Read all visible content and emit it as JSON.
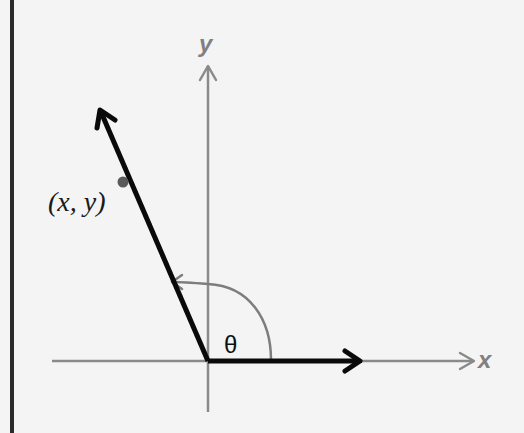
{
  "diagram": {
    "labels": {
      "x_axis": "x",
      "y_axis": "y",
      "point": "(x, y)",
      "angle": "θ"
    },
    "colors": {
      "background": "#f4f4f4",
      "axis": "#8a8a8a",
      "vector": "#0a0a0a",
      "arc": "#7d7d7d",
      "point": "#5a5a5a",
      "border": "#2a2a2a"
    },
    "elements": [
      {
        "type": "axis",
        "name": "x-axis",
        "direction": "horizontal"
      },
      {
        "type": "axis",
        "name": "y-axis",
        "direction": "vertical"
      },
      {
        "type": "vector",
        "name": "reference-vector",
        "direction": "along positive x-axis"
      },
      {
        "type": "vector",
        "name": "rotated-vector",
        "direction": "second quadrant, angle ≈ 113°"
      },
      {
        "type": "point",
        "name": "point-xy",
        "label": "(x, y)"
      },
      {
        "type": "arc",
        "name": "angle-arc",
        "label": "θ",
        "from": "positive x-axis",
        "to": "rotated-vector"
      }
    ]
  }
}
